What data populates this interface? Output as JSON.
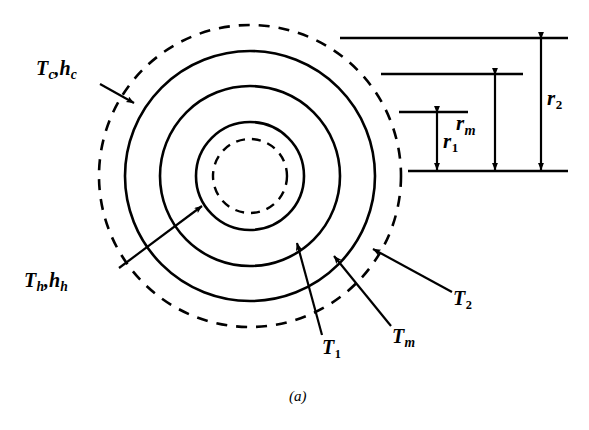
{
  "figure": {
    "caption": "(a)",
    "stroke_color": "#000000",
    "background_color": "#ffffff"
  },
  "geometry": {
    "center": {
      "x": 250,
      "y": 176
    },
    "circles": [
      {
        "name": "cold-boundary-layer",
        "radius": 151,
        "style": "dashed"
      },
      {
        "name": "outer-wall",
        "radius": 125,
        "style": "solid"
      },
      {
        "name": "mean-radius",
        "radius": 90,
        "style": "solid"
      },
      {
        "name": "inner-wall",
        "radius": 54,
        "style": "solid"
      },
      {
        "name": "hot-boundary-layer",
        "radius": 37,
        "style": "dashed"
      }
    ]
  },
  "labels": {
    "cold_fluid": {
      "symbol": "T",
      "sub": "c",
      "symbol2": "h",
      "sub2": "c",
      "text": "Tc, hc"
    },
    "hot_fluid": {
      "symbol": "T",
      "sub": "h",
      "symbol2": "h",
      "sub2": "h",
      "text": "Th, hh"
    },
    "temp_inner": {
      "symbol": "T",
      "sub": "1",
      "text": "T1"
    },
    "temp_mean": {
      "symbol": "T",
      "sub": "m",
      "text": "Tm"
    },
    "temp_outer": {
      "symbol": "T",
      "sub": "2",
      "text": "T2"
    }
  },
  "dimensions": [
    {
      "name": "r1",
      "symbol": "r",
      "sub": "1",
      "text": "r1"
    },
    {
      "name": "rm",
      "symbol": "r",
      "sub": "m",
      "text": "rm"
    },
    {
      "name": "r2",
      "symbol": "r",
      "sub": "2",
      "text": "r2"
    }
  ]
}
